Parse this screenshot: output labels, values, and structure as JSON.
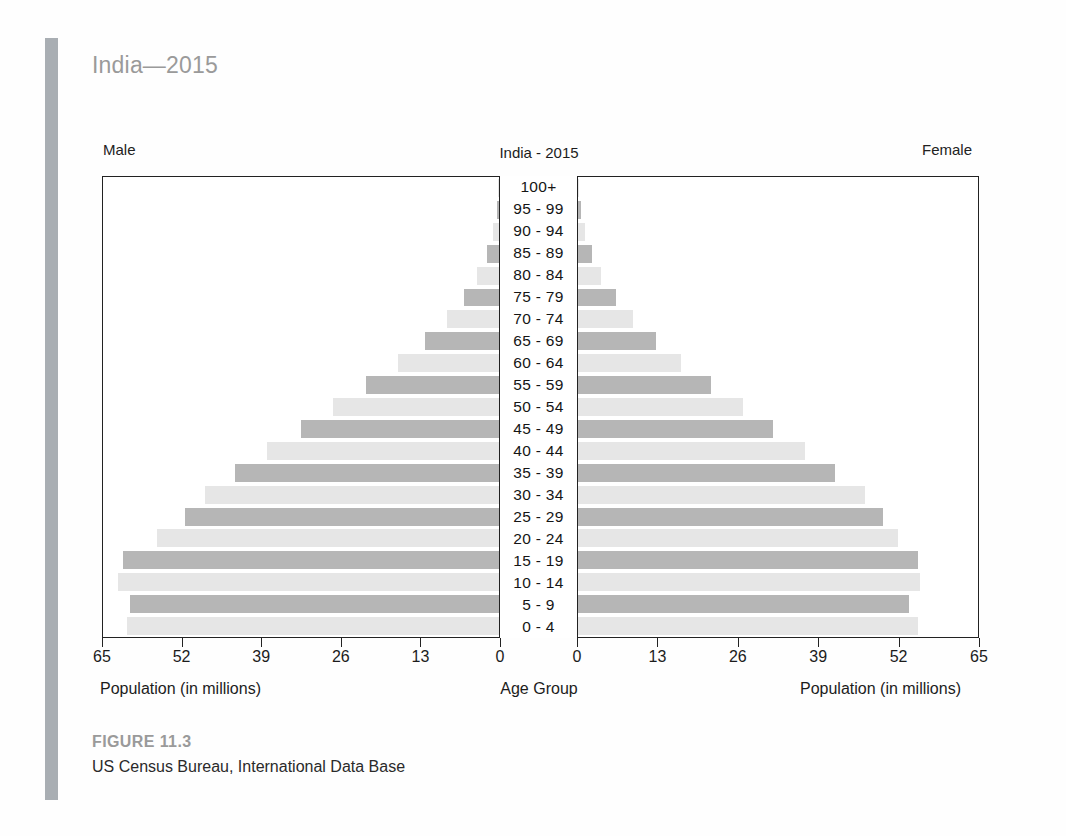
{
  "page": {
    "title": "India—2015",
    "caption_figure": "FIGURE 11.3",
    "caption_source": "US Census Bureau, International Data Base"
  },
  "labels": {
    "male": "Male",
    "female": "Female",
    "age_group": "Age Group",
    "xtitle_left": "Population (in millions)",
    "xtitle_right": "Population (in millions)"
  },
  "colors": {
    "bar_dark": "#b6b6b6",
    "bar_light": "#e6e6e6",
    "axis": "#222222",
    "title_gray": "#9a9a9a",
    "side_rule": "#a9aeb3"
  },
  "chart_data": {
    "type": "bar",
    "title": "India - 2015",
    "subtype": "population-pyramid",
    "xlabel": "Population (in millions)",
    "ylabel": "Age Group",
    "xlim": [
      0,
      65
    ],
    "ticks": [
      0,
      13,
      26,
      39,
      52,
      65
    ],
    "left_tick_labels": [
      "65",
      "52",
      "39",
      "26",
      "13",
      "0"
    ],
    "right_tick_labels": [
      "0",
      "13",
      "26",
      "39",
      "52",
      "65"
    ],
    "grid": false,
    "legend": [
      "Male",
      "Female"
    ],
    "legend_position": "top-outside",
    "categories": [
      "100+",
      "95 - 99",
      "90 - 94",
      "85 - 89",
      "80 - 84",
      "75 - 79",
      "70 - 74",
      "65 - 69",
      "60 - 64",
      "55 - 59",
      "50 - 54",
      "45 - 49",
      "40 - 44",
      "35 - 39",
      "30 - 34",
      "25 - 29",
      "20 - 24",
      "15 - 19",
      "10 - 14",
      "5 - 9",
      "0 - 4"
    ],
    "series": [
      {
        "name": "Male",
        "side": "left",
        "values": [
          0.1,
          0.4,
          1.0,
          2.0,
          3.6,
          5.8,
          8.6,
          12.2,
          16.6,
          21.8,
          27.3,
          32.5,
          38.1,
          43.3,
          48.3,
          51.6,
          56.1,
          61.8,
          62.6,
          60.5,
          61.0
        ]
      },
      {
        "name": "Female",
        "side": "right",
        "values": [
          0.1,
          0.5,
          1.2,
          2.2,
          3.8,
          6.1,
          9.0,
          12.6,
          16.8,
          21.6,
          26.8,
          31.7,
          36.9,
          41.8,
          46.6,
          49.6,
          52.0,
          55.2,
          55.6,
          53.8,
          55.3
        ]
      }
    ],
    "bar_shading": "alternating light/dark gray by age band"
  }
}
